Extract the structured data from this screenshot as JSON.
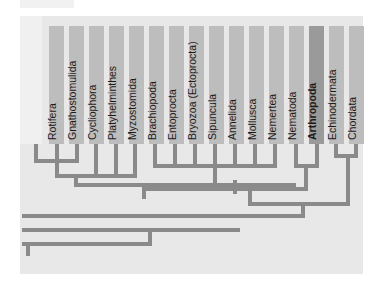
{
  "figure": {
    "taxa": [
      {
        "label": "Rotifera"
      },
      {
        "label": "Gnathostomulida"
      },
      {
        "label": "Cycliophora"
      },
      {
        "label": "Platyhelminthes"
      },
      {
        "label": "Myzostomida"
      },
      {
        "label": "Brachiopoda"
      },
      {
        "label": "Entoprocta"
      },
      {
        "label": "Bryozoa (Ectoprocta)"
      },
      {
        "label": "Sipuncula"
      },
      {
        "label": "Annelida"
      },
      {
        "label": "Mollusca"
      },
      {
        "label": "Nemertea"
      },
      {
        "label": "Nematoda"
      },
      {
        "label": "Arthropoda",
        "highlighted": true
      },
      {
        "label": "Echinodermata"
      },
      {
        "label": "Chordata"
      }
    ],
    "colors": {
      "panel": "#e8e8e8",
      "column": "#bdbdbd",
      "highlight": "#9a9a9a",
      "branch": "#8a8a8a"
    }
  }
}
